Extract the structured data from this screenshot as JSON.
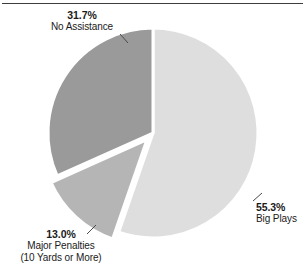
{
  "figure": {
    "has_top_rule": true,
    "background": "#ffffff"
  },
  "chart_data": {
    "type": "pie",
    "title": "",
    "subtitle": "",
    "xlabel": "",
    "ylabel": "",
    "legend_position": "none",
    "grid": false,
    "start_angle_deg": 0,
    "direction": "clockwise",
    "categories": [
      "Big Plays",
      "Major Penalties (10 Yards or More)",
      "No Assistance"
    ],
    "values": [
      55.3,
      13.0,
      31.7
    ],
    "value_unit": "percent",
    "colors": [
      "#dedede",
      "#b5b5b5",
      "#9a9a9a"
    ],
    "slices": [
      {
        "name": "Big Plays",
        "percent_label": "55.3%",
        "value": 55.3,
        "color": "#dedede",
        "label_line1": "55.3%",
        "label_line2": "Big Plays",
        "label_line3": "",
        "exploded": false
      },
      {
        "name": "Major Penalties",
        "percent_label": "13.0%",
        "value": 13.0,
        "color": "#b5b5b5",
        "label_line1": "13.0%",
        "label_line2": "Major Penalties",
        "label_line3": "(10 Yards or More)",
        "exploded": true
      },
      {
        "name": "No Assistance",
        "percent_label": "31.7%",
        "value": 31.7,
        "color": "#9a9a9a",
        "label_line1": "31.7%",
        "label_line2": "No Assistance",
        "label_line3": "",
        "exploded": false
      }
    ]
  },
  "callouts": {
    "no_assistance": {
      "percent": "31.7%",
      "label": "No Assistance"
    },
    "big_plays": {
      "percent": "55.3%",
      "label": "Big Plays"
    },
    "major_penalties": {
      "percent": "13.0%",
      "label": "Major Penalties",
      "sublabel": "(10 Yards or More)"
    }
  }
}
